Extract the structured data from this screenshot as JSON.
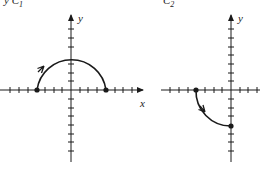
{
  "figure": {
    "curves": [
      {
        "id": "C1",
        "label": "C",
        "subscript": "1",
        "label_prefix": "y",
        "description": "Upper semicircle of radius 4 centered at origin, traversed from (-4,0) to (4,0)",
        "start_point": [
          -4,
          0
        ],
        "end_point": [
          4,
          0
        ],
        "radius": 4,
        "arrow_direction": "clockwise (from left endpoint upward)"
      },
      {
        "id": "C2",
        "label": "C",
        "subscript": "2",
        "description": "Quarter circle of radius 4 from (-4,0) down to (0,-4)",
        "start_point": [
          -4,
          0
        ],
        "end_point": [
          0,
          -4
        ],
        "radius": 4,
        "arrow_direction": "counterclockwise (downward from left endpoint)"
      }
    ],
    "axes": {
      "x_label": "x",
      "y_label": "y",
      "tick_spacing_units": 1
    },
    "colors": {
      "stroke": "#1a1a1a",
      "background": "#ffffff"
    }
  }
}
